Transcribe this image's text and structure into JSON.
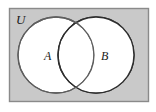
{
  "figure": {
    "type": "venn-diagram",
    "background_color": "#ffffff"
  },
  "universe": {
    "label": "U",
    "fill_color": "#c9c9c9",
    "border_color": "#8a8a8a",
    "x": 9,
    "y": 8,
    "width": 139,
    "height": 93
  },
  "sets": [
    {
      "label": "A",
      "fill_color": "#ffffff",
      "border_color": "#5e5e5e",
      "cx": 56,
      "cy": 55,
      "r": 38,
      "label_x": 44,
      "label_y": 60
    },
    {
      "label": "B",
      "fill_color": "#ffffff",
      "border_color": "#2e2e2e",
      "cx": 96,
      "cy": 55,
      "r": 38,
      "label_x": 101,
      "label_y": 60
    }
  ],
  "universe_label_pos": {
    "x": 16,
    "y": 24
  }
}
